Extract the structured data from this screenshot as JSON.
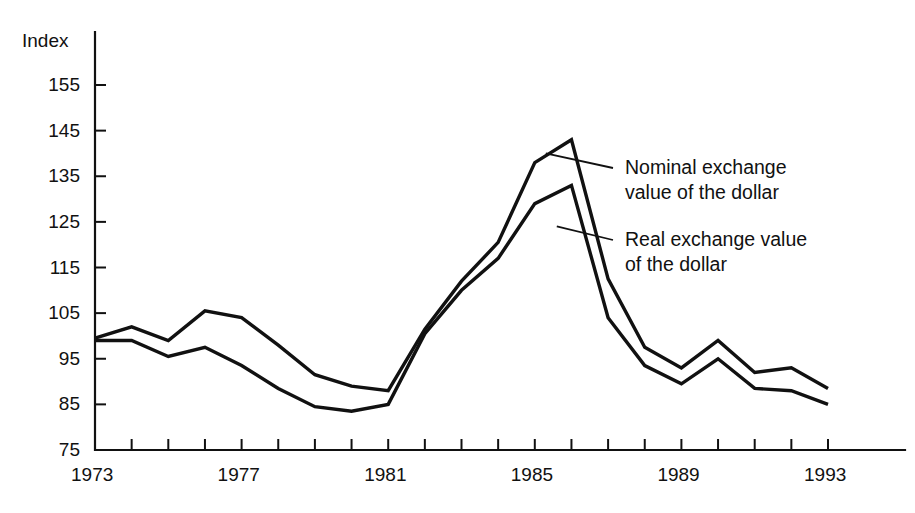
{
  "chart_data": {
    "type": "line",
    "title": "",
    "xlabel": "",
    "ylabel": "Index",
    "x": [
      1973,
      1974,
      1975,
      1976,
      1977,
      1978,
      1979,
      1980,
      1981,
      1982,
      1983,
      1984,
      1985,
      1986,
      1987,
      1988,
      1989,
      1990,
      1991,
      1992,
      1993
    ],
    "xlim": [
      1973,
      1993
    ],
    "ylim": [
      75,
      160
    ],
    "ytick_values": [
      155,
      145,
      135,
      125,
      115,
      105,
      95,
      85,
      75
    ],
    "xtick_labels": [
      "1973",
      "1977",
      "1981",
      "1985",
      "1989",
      "1993"
    ],
    "xtick_labeled_years": [
      1973,
      1977,
      1981,
      1985,
      1989,
      1993
    ],
    "xtick_all_years": [
      1973,
      1974,
      1975,
      1976,
      1977,
      1978,
      1979,
      1980,
      1981,
      1982,
      1983,
      1984,
      1985,
      1986,
      1987,
      1988,
      1989,
      1990,
      1991,
      1992,
      1993
    ],
    "grid": false,
    "legend_position": "inline-annotations",
    "line_color": "#111111",
    "series": [
      {
        "name": "Nominal exchange value of the dollar",
        "values": [
          99.5,
          102.0,
          99.0,
          105.5,
          104.0,
          98.0,
          91.5,
          89.0,
          88.0,
          101.5,
          112.0,
          120.5,
          138.0,
          143.0,
          112.5,
          97.5,
          93.0,
          99.0,
          92.0,
          93.0,
          88.5
        ]
      },
      {
        "name": "Real exchange value of the dollar",
        "values": [
          99.0,
          99.0,
          95.5,
          97.5,
          93.5,
          88.5,
          84.5,
          83.5,
          85.0,
          100.5,
          110.0,
          117.0,
          129.0,
          133.0,
          104.0,
          93.5,
          89.5,
          95.0,
          88.5,
          88.0,
          85.0
        ]
      }
    ],
    "annotations": [
      {
        "id": "nominal-annotation",
        "text": "Nominal exchange\nvalue of the dollar",
        "leader_from_year": 1985.3,
        "leader_from_value": 140.0
      },
      {
        "id": "real-annotation",
        "text": "Real exchange value\nof the dollar",
        "leader_from_year": 1985.6,
        "leader_from_value": 124.0
      }
    ]
  },
  "axis": {
    "y_title": "Index"
  }
}
